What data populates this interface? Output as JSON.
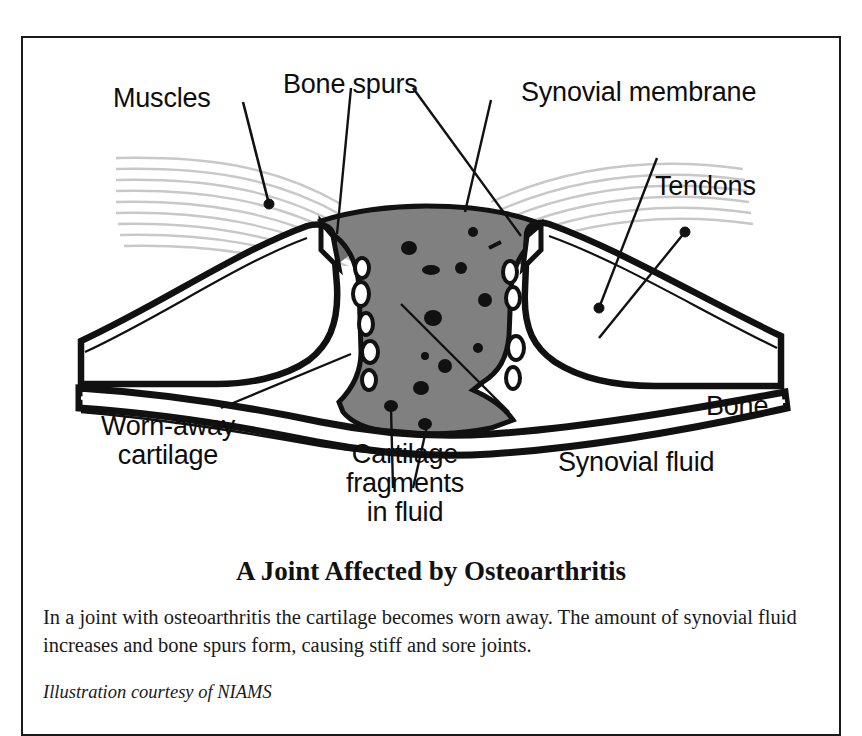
{
  "figure": {
    "title": "A Joint Affected by Osteoarthritis",
    "body": "In a joint with osteoarthritis the cartilage becomes worn away. The amount of synovial fluid increases and bone spurs form, causing stiff and sore joints.",
    "credit": "Illustration courtesy of NIAMS",
    "labels": {
      "muscles": "Muscles",
      "bone_spurs": "Bone spurs",
      "synovial_membrane": "Synovial membrane",
      "tendons": "Tendons",
      "bone": "Bone",
      "synovial_fluid": "Synovial fluid",
      "worn_away_cartilage_line1": "Worn-away",
      "worn_away_cartilage_line2": "cartilage",
      "cartilage_fragments_line1": "Cartilage",
      "cartilage_fragments_line2": "fragments",
      "cartilage_fragments_line3": "in fluid"
    },
    "colors": {
      "outline": "#111111",
      "synovial_fluid_gray": "#808080",
      "tendon_gray": "#6e6e6e",
      "muscle_striation_gray": "#c8c8c8",
      "cartilage_white": "#ffffff",
      "frame_border": "#1a1a1a",
      "background": "#ffffff"
    }
  }
}
